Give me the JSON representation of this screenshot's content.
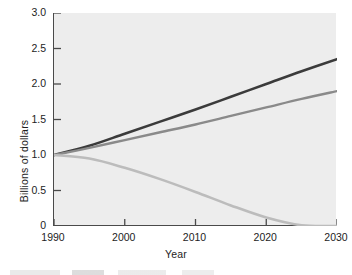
{
  "chart_data": {
    "type": "line",
    "title": "",
    "xlabel": "Year",
    "ylabel": "Billions of dollars",
    "xlim": [
      1990,
      2030
    ],
    "ylim": [
      0,
      3.0
    ],
    "xticks": [
      1990,
      2000,
      2010,
      2020,
      2030
    ],
    "xtick_labels": [
      "1990",
      "2000",
      "2010",
      "2020",
      "2030"
    ],
    "yticks": [
      0,
      0.5,
      1.0,
      1.5,
      2.0,
      2.5,
      3.0
    ],
    "ytick_labels": [
      "0",
      "0.5",
      "1.0",
      "1.5",
      "2.0",
      "2.5",
      "3.0"
    ],
    "grid": false,
    "legend": "none",
    "x": [
      1990,
      1995,
      2000,
      2005,
      2010,
      2015,
      2020,
      2025,
      2030
    ],
    "series": [
      {
        "name": "series-dark",
        "color": "#3b3b3b",
        "values": [
          1.0,
          1.13,
          1.3,
          1.47,
          1.64,
          1.82,
          2.0,
          2.18,
          2.35
        ]
      },
      {
        "name": "series-medium-gray",
        "color": "#8a8a8a",
        "values": [
          1.0,
          1.1,
          1.21,
          1.32,
          1.43,
          1.55,
          1.67,
          1.79,
          1.9
        ]
      },
      {
        "name": "series-light-gray",
        "color": "#bcbcbc",
        "values": [
          1.0,
          0.95,
          0.82,
          0.66,
          0.48,
          0.29,
          0.12,
          0.01,
          0.0
        ]
      }
    ]
  },
  "axis": {
    "y_title": "Billions of dollars",
    "x_title": "Year"
  }
}
